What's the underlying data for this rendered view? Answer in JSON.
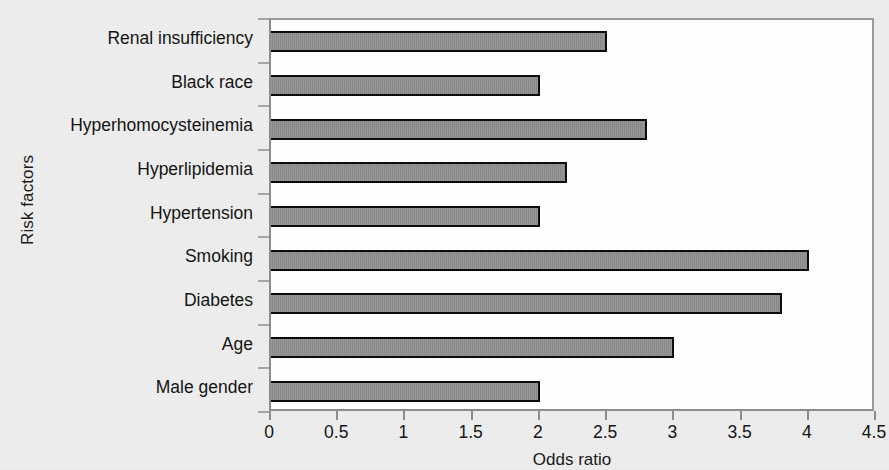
{
  "chart_data": {
    "type": "bar",
    "orientation": "horizontal",
    "title": "",
    "xlabel": "Odds ratio",
    "ylabel": "Risk factors",
    "categories": [
      "Renal insufficiency",
      "Black race",
      "Hyperhomocysteinemia",
      "Hyperlipidemia",
      "Hypertension",
      "Smoking",
      "Diabetes",
      "Age",
      "Male gender"
    ],
    "values": [
      2.5,
      2.0,
      2.8,
      2.2,
      2.0,
      4.0,
      3.8,
      3.0,
      2.0
    ],
    "xlim": [
      0,
      4.5
    ],
    "xticks": [
      0,
      0.5,
      1,
      1.5,
      2,
      2.5,
      3,
      3.5,
      4,
      4.5
    ],
    "xtick_labels": [
      "0",
      "0.5",
      "1",
      "1.5",
      "2",
      "2.5",
      "3",
      "3.5",
      "4",
      "4.5"
    ],
    "grid": false,
    "legend": null,
    "bar_fill_color": "#8c8c8c",
    "bar_edge_color": "#0c0c0c",
    "plot_background": "#ffffff",
    "figure_background": "#ededed"
  }
}
